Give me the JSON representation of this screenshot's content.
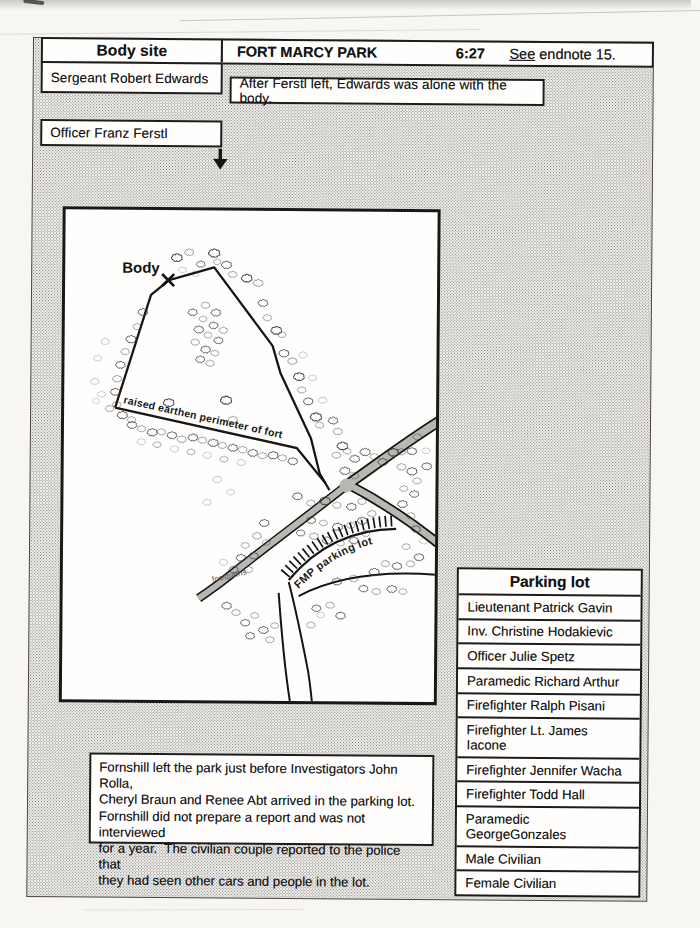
{
  "header": {
    "body_site": "Body site",
    "title": "FORT MARCY PARK",
    "time": "6:27",
    "see_word": "See",
    "endnote_rest": " endnote 15."
  },
  "boxes": {
    "sergeant": "Sergeant Robert Edwards",
    "officer": "Officer Franz Ferstl",
    "after_note": "After Ferstl left, Edwards was alone with the body."
  },
  "map_labels": {
    "body": "Body",
    "perimeter": "raised earthen perimeter of fort",
    "parking": "FMP parking lot",
    "footpaths": "footpaths"
  },
  "parking_table": {
    "title": "Parking lot",
    "rows": [
      "Lieutenant Patrick Gavin",
      "Inv. Christine Hodakievic",
      "Officer Julie Spetz",
      "Paramedic Richard Arthur",
      "Firefighter Ralph Pisani",
      "Firefighter Lt. James Iacone",
      "Firefighter Jennifer Wacha",
      "Firefighter Todd Hall",
      "Paramedic GeorgeGonzales",
      "Male Civilian",
      "Female Civilian"
    ]
  },
  "bottom_note_lines": [
    "Fornshill left the park just before Investigators John Rolla,",
    "Cheryl Braun and Renee Abt arrived in the parking lot.",
    "Fornshill did not prepare a report and was not interviewed",
    "for a year.  The civilian couple reported to the police that",
    "they had seen other cars and people in the lot."
  ],
  "colors": {
    "ink": "#1c1c1c",
    "road_gray": "#b9b7b4",
    "paper": "#f7f6f3"
  }
}
